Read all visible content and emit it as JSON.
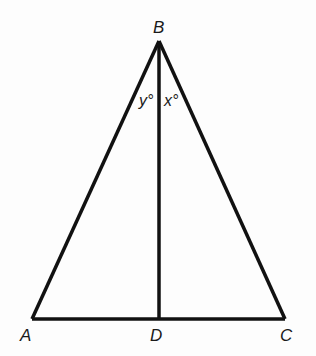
{
  "diagram": {
    "type": "triangle-with-altitude",
    "stroke_color": "#111111",
    "background": "#fdfdfd",
    "points": {
      "A": {
        "label": "A",
        "x": 32,
        "y": 319
      },
      "B": {
        "label": "B",
        "x": 159,
        "y": 41
      },
      "C": {
        "label": "C",
        "x": 285,
        "y": 319
      },
      "D": {
        "label": "D",
        "x": 159,
        "y": 319
      }
    },
    "segments": [
      "AB",
      "BC",
      "AC",
      "BD"
    ],
    "angles": {
      "left": {
        "label": "y°",
        "vertex": "B",
        "between": "AB,BD"
      },
      "right": {
        "label": "x°",
        "vertex": "B",
        "between": "BD,BC"
      }
    }
  }
}
